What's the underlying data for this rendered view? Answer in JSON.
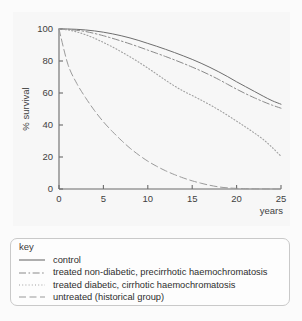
{
  "legend": {
    "title": "key",
    "items": [
      {
        "label": "control",
        "style": "solid"
      },
      {
        "label": "treated non-diabetic, precirrhotic haemochromatosis",
        "style": "dash-dot"
      },
      {
        "label": "treated diabetic, cirrhotic haemochromatosis",
        "style": "dotted"
      },
      {
        "label": "untreated (historical group)",
        "style": "long-dash"
      }
    ]
  },
  "chart_data": {
    "type": "line",
    "title": "",
    "xlabel": "years",
    "ylabel": "% survival",
    "xlim": [
      0,
      25
    ],
    "ylim": [
      0,
      100
    ],
    "xticks": [
      0,
      5,
      10,
      15,
      20,
      25
    ],
    "yticks": [
      0,
      20,
      40,
      60,
      80,
      100
    ],
    "grid": false,
    "legend_position": "below-plot",
    "x": [
      0,
      1,
      2,
      3,
      4,
      5,
      6,
      7,
      8,
      9,
      10,
      11,
      12,
      13,
      14,
      15,
      16,
      17,
      18,
      19,
      20,
      21,
      22,
      23,
      24,
      25
    ],
    "series": [
      {
        "name": "control",
        "style": "solid",
        "color": "#6e6e6e",
        "values": [
          100,
          100,
          99.8,
          99.4,
          98.8,
          98,
          97,
          95.8,
          94.4,
          92.8,
          91,
          89.2,
          87.3,
          85.3,
          83.2,
          81,
          78.6,
          76,
          73.2,
          70.2,
          67,
          64,
          61,
          58,
          55.2,
          53
        ]
      },
      {
        "name": "treated non-diabetic, precirrhotic haemochromatosis",
        "style": "dash-dot",
        "color": "#8a8a8a",
        "values": [
          100,
          99.8,
          99.2,
          98.4,
          97.2,
          95.8,
          94.2,
          92.5,
          90.7,
          88.8,
          86.8,
          84.8,
          82.8,
          80.7,
          78.5,
          76.2,
          73.8,
          71.2,
          68.4,
          65.4,
          62.4,
          59.6,
          57,
          54.6,
          52.4,
          50.5
        ]
      },
      {
        "name": "treated diabetic, cirrhotic haemochromatosis",
        "style": "dotted",
        "color": "#a0a0a0",
        "values": [
          100,
          99.4,
          98.2,
          96.4,
          94.2,
          91.6,
          88.8,
          85.8,
          82.6,
          79.2,
          75.6,
          71.8,
          68,
          64.4,
          61.2,
          58.4,
          55.6,
          52.6,
          49.4,
          46,
          42.4,
          38.8,
          35,
          31,
          26,
          20.5
        ]
      },
      {
        "name": "untreated (historical group)",
        "style": "long-dash",
        "color": "#9a9a9a",
        "values": [
          100,
          78,
          66,
          57,
          49,
          42,
          36,
          30.5,
          25.5,
          21.2,
          17.4,
          14.2,
          11.4,
          9,
          6.9,
          5.1,
          3.6,
          2.3,
          1.3,
          0.7,
          0.4,
          0.2,
          0.1,
          0.05,
          0.02,
          0
        ]
      }
    ]
  }
}
